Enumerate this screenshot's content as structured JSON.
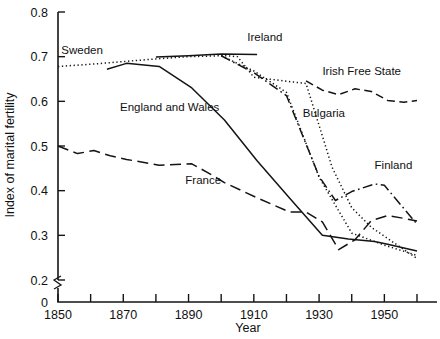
{
  "chart_data": {
    "type": "line",
    "title": "",
    "xlabel": "Year",
    "ylabel": "Index of marital fertility",
    "xlim": [
      1845,
      1962
    ],
    "ylim": [
      0.2,
      0.8
    ],
    "y_axis_break": true,
    "y_break_label": "0",
    "grid": false,
    "legend": "inline-annotations",
    "xticks": [
      1850,
      1860,
      1870,
      1880,
      1890,
      1900,
      1910,
      1920,
      1930,
      1940,
      1950,
      1960
    ],
    "xtick_labels": [
      "1850",
      "",
      "1870",
      "",
      "1890",
      "",
      "1910",
      "",
      "1930",
      "",
      "1950",
      ""
    ],
    "yticks": [
      0.2,
      0.3,
      0.4,
      0.5,
      0.6,
      0.7,
      0.8
    ],
    "ytick_labels": [
      "0.2",
      "0.3",
      "0.4",
      "0.5",
      "0.6",
      "0.7",
      "0.8"
    ],
    "series": [
      {
        "name": "Ireland",
        "style": "solid",
        "label_x": 1908,
        "label_y": 0.735,
        "x": [
          1880,
          1890,
          1900,
          1911
        ],
        "y": [
          0.699,
          0.702,
          0.706,
          0.705
        ]
      },
      {
        "name": "Sweden",
        "style": "dotted",
        "label_x": 1851,
        "label_y": 0.707,
        "x": [
          1850,
          1860,
          1870,
          1880,
          1890,
          1900,
          1910,
          1920,
          1930,
          1940,
          1950,
          1960
        ],
        "y": [
          0.678,
          0.683,
          0.689,
          0.695,
          0.7,
          0.702,
          0.668,
          0.62,
          0.43,
          0.305,
          0.278,
          0.255
        ]
      },
      {
        "name": "England and Wales",
        "style": "solid",
        "label_x": 1869,
        "label_y": 0.578,
        "x": [
          1865,
          1871,
          1881,
          1891,
          1901,
          1911,
          1921,
          1931,
          1939,
          1947,
          1951,
          1960
        ],
        "y": [
          0.672,
          0.685,
          0.678,
          0.63,
          0.558,
          0.467,
          0.383,
          0.3,
          0.292,
          0.286,
          0.28,
          0.265
        ]
      },
      {
        "name": "Bulgaria",
        "style": "dotted",
        "label_x": 1925,
        "label_y": 0.565,
        "x": [
          1900,
          1905,
          1910,
          1920,
          1926,
          1934,
          1940,
          1946,
          1956,
          1960
        ],
        "y": [
          0.703,
          0.7,
          0.654,
          0.645,
          0.64,
          0.452,
          0.362,
          0.318,
          0.268,
          0.248
        ]
      },
      {
        "name": "Finland",
        "style": "dash-dot",
        "label_x": 1947,
        "label_y": 0.448,
        "x": [
          1900,
          1910,
          1920,
          1930,
          1935,
          1940,
          1947,
          1950,
          1960
        ],
        "y": [
          0.702,
          0.664,
          0.613,
          0.432,
          0.378,
          0.398,
          0.415,
          0.412,
          0.325
        ]
      },
      {
        "name": "France",
        "style": "long-dash",
        "label_x": 1889,
        "label_y": 0.415,
        "x": [
          1850,
          1856,
          1861,
          1866,
          1871,
          1881,
          1891,
          1896,
          1901,
          1911,
          1921,
          1926,
          1931,
          1936,
          1941,
          1946,
          1951,
          1956,
          1960
        ],
        "y": [
          0.5,
          0.483,
          0.49,
          0.478,
          0.47,
          0.457,
          0.46,
          0.44,
          0.418,
          0.384,
          0.352,
          0.352,
          0.33,
          0.268,
          0.29,
          0.333,
          0.344,
          0.338,
          0.332
        ]
      },
      {
        "name": "Irish Free State",
        "style": "dash",
        "label_x": 1931,
        "label_y": 0.658,
        "x": [
          1926,
          1931,
          1936,
          1941,
          1946,
          1951,
          1956,
          1960
        ],
        "y": [
          0.646,
          0.625,
          0.615,
          0.628,
          0.622,
          0.602,
          0.598,
          0.602
        ]
      }
    ]
  }
}
